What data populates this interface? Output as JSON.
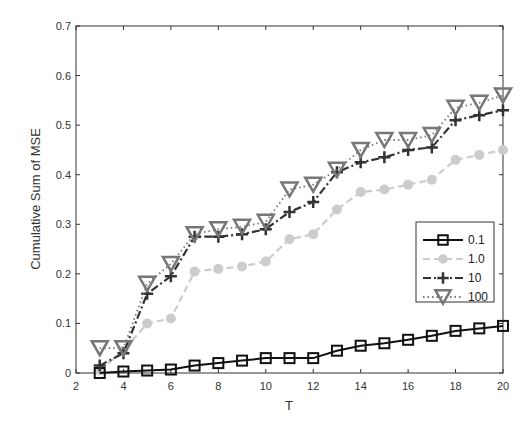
{
  "chart_data": {
    "type": "line",
    "title": "",
    "xlabel": "T",
    "ylabel": "Cumulative Sum of MSE",
    "xlim": [
      2,
      20
    ],
    "ylim": [
      0,
      0.7
    ],
    "xticks": [
      2,
      4,
      6,
      8,
      10,
      12,
      14,
      16,
      18,
      20
    ],
    "yticks": [
      0,
      0.1,
      0.2,
      0.3,
      0.4,
      0.5,
      0.6,
      0.7
    ],
    "ytick_labels": [
      "0",
      "0.1",
      "0.2",
      "0.3",
      "0.4",
      "0.5",
      "0.6",
      "0.7"
    ],
    "grid": false,
    "legend_position": "right-center inside axes",
    "x": [
      3,
      4,
      5,
      6,
      7,
      8,
      9,
      10,
      11,
      12,
      13,
      14,
      15,
      16,
      17,
      18,
      19,
      20
    ],
    "series": [
      {
        "name": "0.1",
        "marker": "square",
        "line_style": "solid",
        "color": "#111111",
        "values": [
          0.0,
          0.003,
          0.005,
          0.007,
          0.015,
          0.02,
          0.025,
          0.03,
          0.03,
          0.03,
          0.045,
          0.055,
          0.06,
          0.067,
          0.075,
          0.085,
          0.09,
          0.095
        ]
      },
      {
        "name": "1.0",
        "marker": "circle",
        "line_style": "dashed",
        "color": "#cccccc",
        "values": [
          0.005,
          0.045,
          0.1,
          0.11,
          0.205,
          0.21,
          0.215,
          0.225,
          0.27,
          0.28,
          0.33,
          0.365,
          0.37,
          0.38,
          0.39,
          0.43,
          0.44,
          0.45
        ]
      },
      {
        "name": "10",
        "marker": "plus",
        "line_style": "dash-dot",
        "color": "#333333",
        "values": [
          0.015,
          0.04,
          0.16,
          0.195,
          0.275,
          0.275,
          0.28,
          0.29,
          0.325,
          0.345,
          0.405,
          0.425,
          0.435,
          0.45,
          0.455,
          0.51,
          0.52,
          0.53
        ]
      },
      {
        "name": "100",
        "marker": "triangle-down",
        "line_style": "dotted",
        "color": "#777777",
        "values": [
          0.05,
          0.05,
          0.18,
          0.22,
          0.28,
          0.29,
          0.295,
          0.305,
          0.37,
          0.38,
          0.41,
          0.45,
          0.47,
          0.47,
          0.48,
          0.535,
          0.545,
          0.56
        ]
      }
    ]
  }
}
